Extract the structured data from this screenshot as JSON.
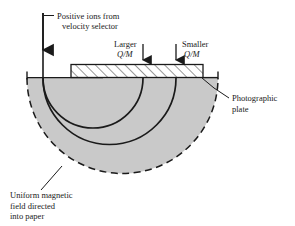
{
  "figure": {
    "background_color": "#ffffff",
    "field_region_color": "#c9c9c9",
    "line_color": "#1a1a1a",
    "plate_fill_color": "#ffffff"
  },
  "labels": {
    "beam_line1": "Positive ions from",
    "beam_line2": "velocity selector",
    "larger_line1": "Larger",
    "larger_line2": "Q/M",
    "smaller_line1": "Smaller",
    "smaller_line2": "Q/M",
    "plate_line1": "Photographic",
    "plate_line2": "plate",
    "field_line1": "Uniform magnetic",
    "field_line2": "field directed",
    "field_line3": "into paper"
  },
  "elements": {
    "incoming_beam": "incoming-ion-beam",
    "field_region": "uniform-magnetic-field-region",
    "photographic_plate": "photographic-plate",
    "trajectory_larger": "ion-trajectory-larger-qm",
    "trajectory_smaller": "ion-trajectory-smaller-qm",
    "impact_arrow_larger": "impact-arrow-larger-qm",
    "impact_arrow_smaller": "impact-arrow-smaller-qm"
  }
}
